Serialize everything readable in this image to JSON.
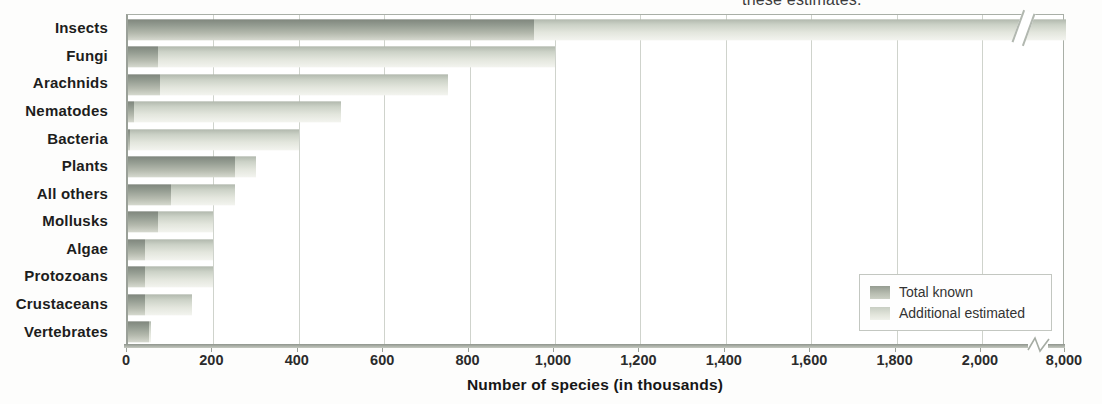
{
  "caption_fragment": "these estimates.",
  "chart_data": {
    "type": "bar",
    "orientation": "horizontal",
    "stacked": true,
    "title": "",
    "xlabel": "Number of species (in thousands)",
    "categories": [
      "Insects",
      "Fungi",
      "Arachnids",
      "Nematodes",
      "Bacteria",
      "Plants",
      "All others",
      "Mollusks",
      "Algae",
      "Protozoans",
      "Crustaceans",
      "Vertebrates"
    ],
    "series": [
      {
        "name": "Total known",
        "values": [
          950,
          70,
          75,
          15,
          4,
          250,
          100,
          70,
          40,
          40,
          40,
          50
        ]
      },
      {
        "name": "Additional estimated",
        "values": [
          7050,
          930,
          675,
          485,
          396,
          50,
          150,
          130,
          160,
          160,
          110,
          5
        ]
      }
    ],
    "estimated_totals": [
      8000,
      1000,
      750,
      500,
      400,
      300,
      250,
      200,
      200,
      200,
      150,
      55
    ],
    "x_ticks": [
      "0",
      "200",
      "400",
      "600",
      "800",
      "1,000",
      "1,200",
      "1,400",
      "1,600",
      "1,800",
      "2,000",
      "8,000"
    ],
    "x_tick_values": [
      0,
      200,
      400,
      600,
      800,
      1000,
      1200,
      1400,
      1600,
      1800,
      2000,
      8000
    ],
    "xlim": [
      0,
      8000
    ],
    "axis_break_between": [
      2000,
      8000
    ],
    "grid": true,
    "legend_position": "bottom-right",
    "colors": {
      "total_known_top": "#7f867d",
      "total_known_bottom": "#d6d9cf",
      "additional_top": "#b1b8ad",
      "additional_bottom": "#f3f4ef",
      "gridline": "#cfd3cc",
      "axis": "#8f958d"
    }
  },
  "legend": {
    "items": [
      {
        "label": "Total known",
        "swatch": "dark"
      },
      {
        "label": "Additional estimated",
        "swatch": "light"
      }
    ]
  }
}
